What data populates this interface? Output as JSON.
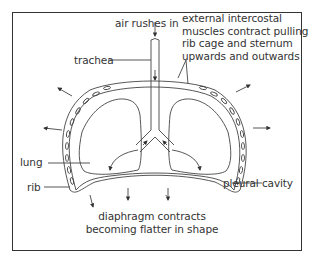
{
  "diagram": {
    "title": "",
    "labels": {
      "air_rushes_in": "air rushes in",
      "trachea": "trachea",
      "intercostal_line1": "external intercostal",
      "intercostal_line2": "muscles contract pulling",
      "intercostal_line3": "rib cage and sternum",
      "intercostal_line4": "upwards and outwards",
      "lung": "lung",
      "rib": "rib",
      "pleural_cavity": "pleural cavity",
      "diaphragm_line1": "diaphragm contracts",
      "diaphragm_line2": "becoming flatter in shape"
    },
    "colors": {
      "line": "#333333",
      "frame": "#333333",
      "background": "#ffffff"
    }
  }
}
